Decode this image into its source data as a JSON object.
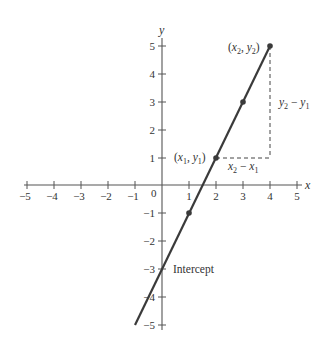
{
  "diagram": {
    "axes": {
      "x_label": "x",
      "y_label": "y",
      "origin_label": "0",
      "x_ticks": [
        "−5",
        "−4",
        "−3",
        "−2",
        "−1",
        "1",
        "2",
        "3",
        "4",
        "5"
      ],
      "y_ticks": [
        "5",
        "4",
        "3",
        "2",
        "1",
        "−1",
        "−2",
        "−3",
        "−4",
        "−5"
      ],
      "x_range": [
        -5,
        5
      ],
      "y_range": [
        -5,
        5
      ]
    },
    "line": {
      "equation": "y = 2x − 3",
      "slope": 2,
      "intercept": -3,
      "from": [
        -1,
        -5
      ],
      "to": [
        4,
        5
      ],
      "color": "#3a3a3a"
    },
    "points": [
      {
        "x": 1,
        "y": -1
      },
      {
        "x": 2,
        "y": 1
      },
      {
        "x": 3,
        "y": 3
      },
      {
        "x": 4,
        "y": 5
      }
    ],
    "labels": {
      "p1": {
        "open": "(",
        "x": "x",
        "xsub": "1",
        "sep": ", ",
        "y": "y",
        "ysub": "1",
        "close": ")"
      },
      "p2": {
        "open": "(",
        "x": "x",
        "xsub": "2",
        "sep": ", ",
        "y": "y",
        "ysub": "2",
        "close": ")"
      },
      "rise": {
        "a": "y",
        "asub": "2",
        "op": " − ",
        "b": "y",
        "bsub": "1"
      },
      "run": {
        "a": "x",
        "asub": "2",
        "op": " − ",
        "b": "x",
        "bsub": "1"
      },
      "intercept": "Intercept"
    },
    "colors": {
      "axis": "#555555",
      "line": "#3a3a3a",
      "dashed": "#444444",
      "text": "#333333"
    }
  }
}
